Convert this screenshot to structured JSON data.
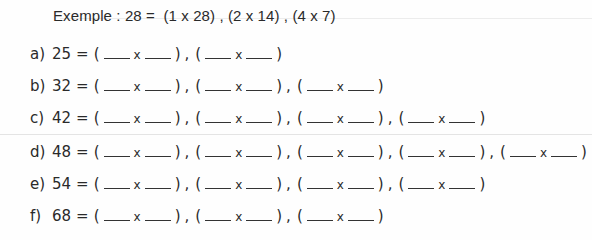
{
  "example": {
    "label": "Exemple :",
    "number": "28",
    "equals": "=",
    "pairs_text": "(1 x 28) , (2 x 14) , (4 x 7)"
  },
  "exercises": [
    {
      "letter": "a)",
      "number": "25",
      "pairs": 2
    },
    {
      "letter": "b)",
      "number": "32",
      "pairs": 3
    },
    {
      "letter": "c)",
      "number": "42",
      "pairs": 4
    },
    {
      "letter": "d)",
      "number": "48",
      "pairs": 5
    },
    {
      "letter": "e)",
      "number": "54",
      "pairs": 4
    },
    {
      "letter": "f)",
      "number": "68",
      "pairs": 3
    }
  ],
  "symbols": {
    "equals": "=",
    "times": "x",
    "open": "(",
    "close": ")",
    "comma": ","
  }
}
